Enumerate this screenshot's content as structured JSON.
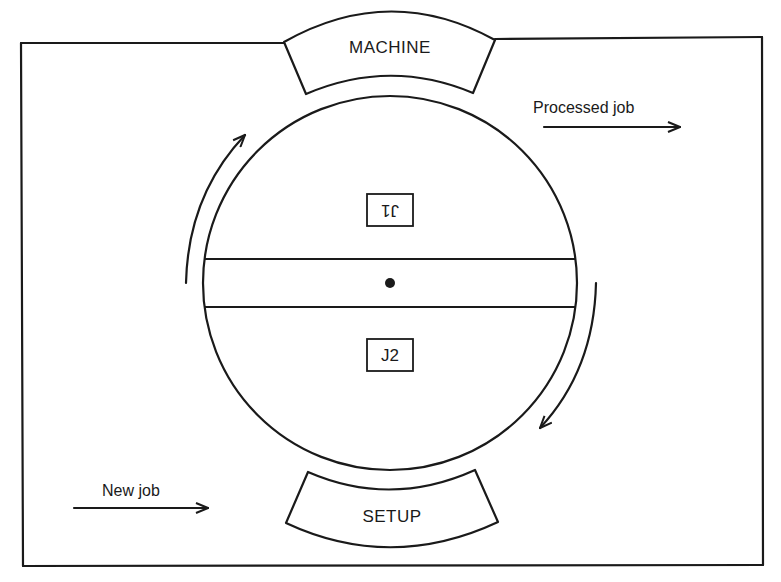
{
  "diagram": {
    "type": "rotary-machine-setup-diagram",
    "colors": {
      "line": "#1a1a1a",
      "background": "#ffffff"
    },
    "stations": {
      "top": {
        "label": "MACHINE"
      },
      "bottom": {
        "label": "SETUP"
      }
    },
    "turntable": {
      "slots": [
        {
          "label": "J1",
          "orientation": "upside-down",
          "position": "top-half"
        },
        {
          "label": "J2",
          "orientation": "upright",
          "position": "bottom-half"
        }
      ],
      "center_marker": "pivot-dot",
      "rotation_arrows": [
        "left-arrow-upward",
        "right-arrow-downward"
      ]
    },
    "flows": {
      "output": {
        "label": "Processed job",
        "direction": "right"
      },
      "input": {
        "label": "New job",
        "direction": "right"
      }
    }
  }
}
